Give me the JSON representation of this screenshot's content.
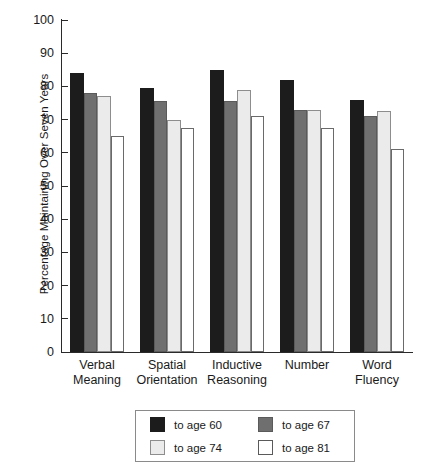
{
  "chart_data": {
    "type": "bar",
    "title": "",
    "xlabel": "",
    "ylabel": "Percentage Maintaining Over Seven Years",
    "ylim": [
      0,
      100
    ],
    "yticks": [
      0,
      10,
      20,
      30,
      40,
      50,
      60,
      70,
      80,
      90,
      100
    ],
    "grid": false,
    "legend_position": "bottom",
    "categories": [
      "Verbal Meaning",
      "Spatial Orientation",
      "Inductive Reasoning",
      "Number",
      "Word Fluency"
    ],
    "category_lines": [
      [
        "Verbal",
        "Meaning"
      ],
      [
        "Spatial",
        "Orientation"
      ],
      [
        "Inductive",
        "Reasoning"
      ],
      [
        "Number",
        ""
      ],
      [
        "Word",
        "Fluency"
      ]
    ],
    "series": [
      {
        "name": "to age 60",
        "color": "#1c1c1c",
        "values": [
          84,
          79.5,
          85,
          82,
          76
        ]
      },
      {
        "name": "to age 67",
        "color": "#6f6f6f",
        "values": [
          78,
          75.5,
          75.5,
          73,
          71
        ]
      },
      {
        "name": "to age 74",
        "color": "#ebebeb",
        "values": [
          77,
          70,
          79,
          73,
          72.5
        ]
      },
      {
        "name": "to age 81",
        "color": "#ffffff",
        "values": [
          65,
          67.5,
          71,
          67.5,
          61
        ]
      }
    ]
  },
  "legend": {
    "entries": [
      {
        "label": "to age 60"
      },
      {
        "label": "to age 67"
      },
      {
        "label": "to age 74"
      },
      {
        "label": "to age 81"
      }
    ]
  }
}
